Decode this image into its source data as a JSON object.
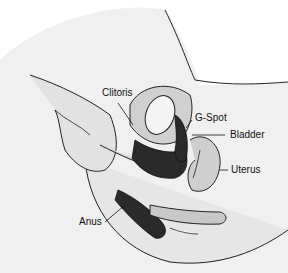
{
  "diagram": {
    "type": "anatomical-illustration",
    "style": "grayscale line drawing",
    "labels": [
      {
        "id": "clitoris",
        "text": "Clitoris"
      },
      {
        "id": "g_spot",
        "text": "G-Spot"
      },
      {
        "id": "bladder",
        "text": "Bladder"
      },
      {
        "id": "uterus",
        "text": "Uterus"
      },
      {
        "id": "anus",
        "text": "Anus"
      }
    ]
  }
}
